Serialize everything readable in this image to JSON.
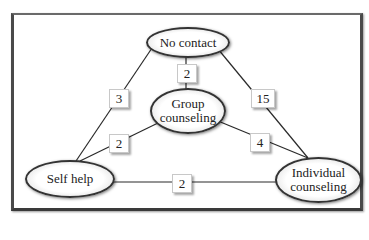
{
  "diagram": {
    "type": "network",
    "nodes": [
      {
        "id": "no_contact",
        "label": "No contact"
      },
      {
        "id": "group",
        "label_line1": "Group",
        "label_line2": "counseling"
      },
      {
        "id": "self_help",
        "label": "Self help"
      },
      {
        "id": "individual",
        "label_line1": "Individual",
        "label_line2": "counseling"
      }
    ],
    "edges": [
      {
        "from": "no_contact",
        "to": "self_help",
        "weight": "3"
      },
      {
        "from": "no_contact",
        "to": "group",
        "weight": "2"
      },
      {
        "from": "no_contact",
        "to": "individual",
        "weight": "15"
      },
      {
        "from": "group",
        "to": "self_help",
        "weight": "2"
      },
      {
        "from": "group",
        "to": "individual",
        "weight": "4"
      },
      {
        "from": "self_help",
        "to": "individual",
        "weight": "2"
      }
    ]
  }
}
